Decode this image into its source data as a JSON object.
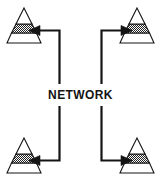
{
  "diagram": {
    "type": "network-topology",
    "title": "NETWORK",
    "center_label": "NETWORK",
    "canvas": {
      "width": 161,
      "height": 189
    },
    "colors": {
      "stroke": "#141414",
      "fill_white": "#ffffff",
      "fill_shaded": "#8c8c8c",
      "background": "#ffffff",
      "text": "#141414"
    },
    "nodes": [
      {
        "id": "node-top-left",
        "label": "",
        "name": "pyramid-top-left",
        "position": "top-left",
        "tiers": [
          "apex-white",
          "middle-shaded",
          "base-white"
        ],
        "tier_count": 3
      },
      {
        "id": "node-top-right",
        "label": "",
        "name": "pyramid-top-right",
        "position": "top-right",
        "tiers": [
          "apex-white",
          "middle-shaded",
          "base-white"
        ],
        "tier_count": 3
      },
      {
        "id": "node-bottom-left",
        "label": "",
        "name": "pyramid-bottom-left",
        "position": "bottom-left",
        "tiers": [
          "apex-white",
          "middle-shaded",
          "base-white"
        ],
        "tier_count": 3
      },
      {
        "id": "node-bottom-right",
        "label": "",
        "name": "pyramid-bottom-right",
        "position": "bottom-right",
        "tiers": [
          "apex-white",
          "middle-shaded",
          "base-white"
        ],
        "tier_count": 3
      }
    ],
    "connectors": [
      {
        "id": "connector-top-left",
        "name": "arrow-network-to-top-left",
        "from": "network",
        "to": "node-top-left",
        "arrowhead": "left",
        "shape": "elbow"
      },
      {
        "id": "connector-top-right",
        "name": "arrow-network-to-top-right",
        "from": "network",
        "to": "node-top-right",
        "arrowhead": "right",
        "shape": "elbow"
      },
      {
        "id": "connector-bottom-left",
        "name": "arrow-network-to-bottom-left",
        "from": "network",
        "to": "node-bottom-left",
        "arrowhead": "left",
        "shape": "elbow"
      },
      {
        "id": "connector-bottom-right",
        "name": "arrow-network-to-bottom-right",
        "from": "network",
        "to": "node-bottom-right",
        "arrowhead": "right",
        "shape": "elbow"
      }
    ]
  }
}
